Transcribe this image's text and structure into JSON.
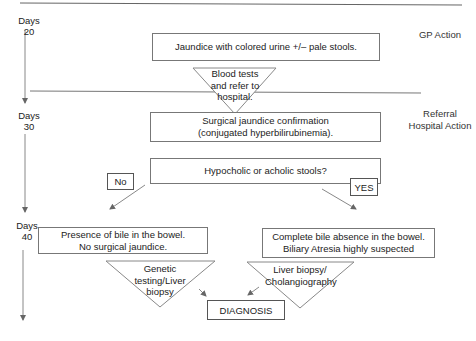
{
  "timeline": {
    "markers": [
      {
        "label": "Days",
        "value": "20"
      },
      {
        "label": "Days",
        "value": "30"
      },
      {
        "label": "Days",
        "value": "40"
      }
    ]
  },
  "phases": {
    "gp": "GP Action",
    "referral_line1": "Referral",
    "referral_line2": "Hospital Action"
  },
  "nodes": {
    "jaundice": "Jaundice with colored urine +/– pale stools.",
    "blood_tests": {
      "line1": "Blood tests",
      "line2": "and refer to",
      "line3": "hospital."
    },
    "confirmation": {
      "line1": "Surgical jaundice confirmation",
      "line2": "(conjugated hyperbilirubinemia)."
    },
    "stools_question": "Hypocholic or acholic stools?",
    "no_label": "No",
    "yes_label": "YES",
    "bile_present": {
      "line1": "Presence of bile in the bowel.",
      "line2": "No surgical jaundice."
    },
    "bile_absent": {
      "line1": "Complete bile absence in the bowel.",
      "line2": "Biliary Atresia highly suspected"
    },
    "genetic_testing": {
      "line1": "Genetic",
      "line2": "testing/Liver",
      "line3": "biopsy"
    },
    "liver_biopsy": {
      "line1": "Liver biopsy/",
      "line2": "Cholangiography"
    },
    "diagnosis": "DIAGNOSIS"
  },
  "colors": {
    "line": "#777777",
    "text": "#222222",
    "background": "#ffffff"
  }
}
